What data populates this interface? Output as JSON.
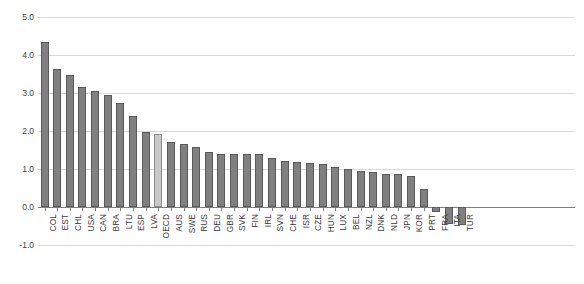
{
  "chart_data": {
    "type": "bar",
    "title": "",
    "subtitle": "",
    "xlabel": "",
    "ylabel": "",
    "ylim": [
      -1.0,
      5.0
    ],
    "yticks": [
      "5.0",
      "4.0",
      "3.0",
      "2.0",
      "1.0",
      "0.0",
      "-1.0"
    ],
    "ytick_values": [
      5.0,
      4.0,
      3.0,
      2.0,
      1.0,
      0.0,
      -1.0
    ],
    "grid": true,
    "legend": "none",
    "highlight_category": "OECD",
    "colors": {
      "bar_fill": "#808080",
      "bar_stroke": "#595959",
      "highlight_fill": "#c8c8c8",
      "highlight_stroke": "#8c8c8c",
      "gridline": "#d9d9d9",
      "axis": "#7f7f7f",
      "text": "#3f3f3f",
      "background": "#ffffff"
    },
    "categories": [
      "COL",
      "EST",
      "CHL",
      "USA",
      "CAN",
      "BRA",
      "LTU",
      "ESP",
      "LVA",
      "OECD",
      "AUS",
      "SWE",
      "RUS",
      "DEU",
      "GBR",
      "SVK",
      "FIN",
      "IRL",
      "SVN",
      "CHE",
      "ISR",
      "CZE",
      "HUN",
      "LUX",
      "BEL",
      "NZL",
      "DNK",
      "NLD",
      "JPN",
      "KOR",
      "PRT",
      "FRA",
      "ITA",
      "TUR"
    ],
    "values": [
      4.35,
      3.62,
      3.48,
      3.17,
      3.06,
      2.94,
      2.74,
      2.4,
      1.98,
      1.92,
      1.7,
      1.67,
      1.57,
      1.45,
      1.4,
      1.4,
      1.39,
      1.39,
      1.3,
      1.22,
      1.18,
      1.15,
      1.12,
      1.05,
      1.0,
      0.96,
      0.92,
      0.88,
      0.87,
      0.82,
      0.47,
      -0.13,
      -0.45,
      -0.47
    ]
  }
}
